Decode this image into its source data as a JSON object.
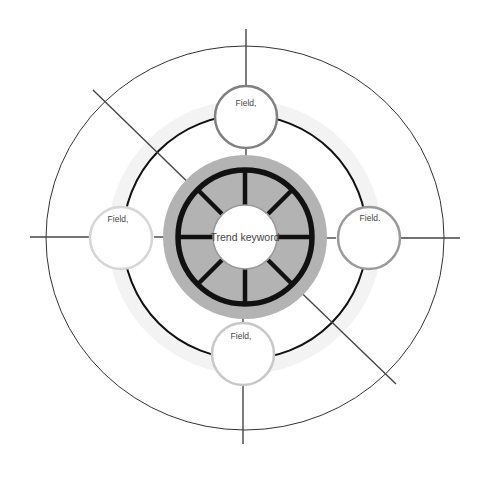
{
  "diagram": {
    "center": {
      "label": "Trend keyword"
    },
    "fields": [
      {
        "id": "top",
        "label": "Field,",
        "border_color": "#808080"
      },
      {
        "id": "left",
        "label": "Field,",
        "border_color": "#d6d6d6"
      },
      {
        "id": "right",
        "label": "Field.",
        "border_color": "#9a9a9a"
      },
      {
        "id": "bottom",
        "label": "Field,",
        "border_color": "#c8c8c8"
      }
    ],
    "colors": {
      "ring_fill": "#b3b3b3",
      "thick_ring": "#111111",
      "middle_circle": "#111111",
      "outer_circle": "#333333",
      "glow": "#f2f2f2"
    }
  }
}
